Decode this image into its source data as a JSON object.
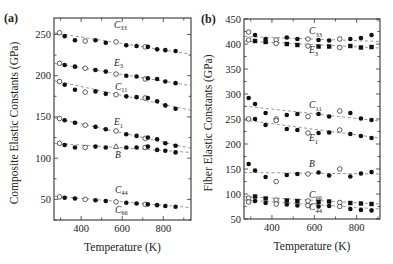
{
  "chart_data": [
    {
      "type": "scatter",
      "panel_label": "(a)",
      "title": "",
      "xlabel": "Temperature (K)",
      "ylabel": "Composite Elastic Constants (GPa)",
      "xlim": [
        268,
        935
      ],
      "ylim": [
        25,
        270
      ],
      "xticks": [
        400,
        600,
        800
      ],
      "yticks": [
        50,
        100,
        150,
        200,
        250
      ],
      "grid": false,
      "legend": "inline labels",
      "x": [
        295,
        320,
        370,
        420,
        470,
        520,
        570,
        620,
        670,
        712,
        725,
        770,
        810,
        860
      ],
      "series": [
        {
          "name": "C33",
          "label_main": "C",
          "label_sub": "33",
          "label_pos": [
            560,
            258
          ],
          "fit": [
            252,
            226
          ],
          "values": [
            252,
            248,
            243,
            242,
            243,
            240,
            241,
            237,
            236,
            235,
            235,
            232,
            231,
            230
          ],
          "markers": [
            "o",
            "f",
            "f",
            "o",
            "f",
            "f",
            "o",
            "f",
            "f",
            "o",
            "f",
            "f",
            "f",
            "f"
          ]
        },
        {
          "name": "E3",
          "label_main": "E",
          "label_sub": "3",
          "label_pos": [
            560,
            212
          ],
          "fit": [
            215,
            188
          ],
          "values": [
            215,
            213,
            211,
            209,
            207,
            205,
            202,
            200,
            199,
            196,
            197,
            196,
            193,
            191
          ],
          "markers": [
            "o",
            "f",
            "f",
            "o",
            "f",
            "f",
            "o",
            "f",
            "f",
            "o",
            "f",
            "f",
            "f",
            "f"
          ]
        },
        {
          "name": "C11",
          "label_main": "C",
          "label_sub": "11",
          "label_pos": [
            565,
            183
          ],
          "fit": [
            194,
            158
          ],
          "values": [
            193,
            189,
            183,
            180,
            181,
            178,
            177,
            175,
            174,
            173,
            173,
            169,
            164,
            160
          ],
          "markers": [
            "o",
            "f",
            "f",
            "o",
            "f",
            "f",
            "o",
            "f",
            "f",
            "o",
            "f",
            "f",
            "f",
            "f"
          ]
        },
        {
          "name": "E1",
          "label_main": "E",
          "label_sub": "1",
          "label_pos": [
            560,
            140
          ],
          "fit": [
            149,
            112
          ],
          "values": [
            148,
            146,
            143,
            140,
            138,
            135,
            133,
            129,
            127,
            124,
            125,
            123,
            118,
            115
          ],
          "markers": [
            "o",
            "f",
            "f",
            "o",
            "f",
            "f",
            "o",
            "f",
            "f",
            "o",
            "f",
            "f",
            "f",
            "f"
          ]
        },
        {
          "name": "B",
          "label_main": "B",
          "label_sub": "",
          "label_pos": [
            565,
            100
          ],
          "fit": [
            118,
            107
          ],
          "values": [
            118,
            116,
            113,
            113,
            114,
            113,
            114,
            113,
            113,
            113,
            114,
            110,
            109,
            107
          ],
          "markers": [
            "o",
            "f",
            "f",
            "o",
            "f",
            "f",
            "t",
            "f",
            "f",
            "o",
            "f",
            "f",
            "f",
            "f"
          ]
        },
        {
          "name": "C44",
          "label_main": "C",
          "label_sub": "44",
          "label_pos": [
            565,
            58
          ],
          "fit": [
            54,
            40
          ],
          "values": [
            53,
            52,
            51,
            50,
            49,
            48,
            47,
            46,
            45,
            44,
            44,
            43,
            42,
            41
          ],
          "markers": [
            "o",
            "f",
            "f",
            "o",
            "f",
            "f",
            "o",
            "f",
            "f",
            "o",
            "f",
            "f",
            "f",
            "f"
          ]
        },
        {
          "name": "C66",
          "label_main": "C",
          "label_sub": "66",
          "label_pos": [
            565,
            34
          ],
          "fit": null,
          "values": [],
          "markers": []
        }
      ]
    },
    {
      "type": "scatter",
      "panel_label": "(b)",
      "title": "",
      "xlabel": "Temperature (K)",
      "ylabel": "Fiber Elastic Constants (GPa)",
      "xlim": [
        268,
        910
      ],
      "ylim": [
        50,
        450
      ],
      "xticks": [
        400,
        600,
        800
      ],
      "yticks": [
        50,
        100,
        150,
        200,
        250,
        300,
        350,
        400,
        450
      ],
      "grid": false,
      "legend": "inline labels",
      "x": [
        290,
        320,
        370,
        420,
        470,
        520,
        570,
        620,
        670,
        720,
        770,
        820,
        870
      ],
      "series": [
        {
          "name": "C33",
          "label_main": "C",
          "label_sub": "33",
          "label_pos": [
            575,
            420
          ],
          "fit": [
            415,
            405
          ],
          "values": [
            424,
            418,
            410,
            408,
            413,
            410,
            410,
            408,
            407,
            410,
            410,
            412,
            418
          ],
          "markers": [
            "o",
            "f",
            "f",
            "o",
            "f",
            "f",
            "o",
            "f",
            "f",
            "o",
            "f",
            "f",
            "f"
          ]
        },
        {
          "name": "E3",
          "label_main": "E",
          "label_sub": "3",
          "label_pos": [
            575,
            382
          ],
          "fit": [
            406,
            392
          ],
          "values": [
            408,
            406,
            404,
            401,
            400,
            398,
            396,
            395,
            395,
            393,
            396,
            393,
            394
          ],
          "markers": [
            "o",
            "s",
            "s",
            "o",
            "s",
            "s",
            "o",
            "s",
            "s",
            "o",
            "s",
            "s",
            "s"
          ]
        },
        {
          "name": "C11",
          "label_main": "C",
          "label_sub": "11",
          "label_pos": [
            575,
            272
          ],
          "fit": [
            276,
            246
          ],
          "values": [
            292,
            280,
            262,
            250,
            258,
            260,
            255,
            260,
            255,
            266,
            262,
            251,
            248
          ],
          "markers": [
            "f",
            "f",
            "f",
            "o",
            "f",
            "f",
            "o",
            "f",
            "f",
            "o",
            "f",
            "f",
            "f"
          ]
        },
        {
          "name": "E1",
          "label_main": "E",
          "label_sub": "1",
          "label_pos": [
            575,
            206
          ],
          "fit": [
            248,
            212
          ],
          "values": [
            250,
            250,
            238,
            247,
            230,
            228,
            222,
            222,
            223,
            228,
            220,
            216,
            212
          ],
          "markers": [
            "o",
            "f",
            "f",
            "o",
            "f",
            "f",
            "o",
            "f",
            "f",
            "o",
            "f",
            "f",
            "f"
          ]
        },
        {
          "name": "B",
          "label_main": "B",
          "label_sub": "",
          "label_pos": [
            575,
            155
          ],
          "fit": [
            143,
            140
          ],
          "values": [
            160,
            147,
            134,
            125,
            138,
            140,
            140,
            143,
            137,
            150,
            135,
            141,
            144
          ],
          "markers": [
            "f",
            "f",
            "f",
            "o",
            "f",
            "f",
            "o",
            "f",
            "f",
            "o",
            "f",
            "f",
            "f"
          ]
        },
        {
          "name": "C66",
          "label_main": "C",
          "label_sub": "66",
          "label_pos": [
            575,
            93
          ],
          "fit": [
            95,
            80
          ],
          "values": [
            92,
            95,
            91,
            88,
            87,
            86,
            86,
            84,
            85,
            83,
            82,
            81,
            80
          ],
          "markers": [
            "o",
            "s",
            "s",
            "o",
            "s",
            "s",
            "o",
            "s",
            "s",
            "o",
            "s",
            "s",
            "s"
          ]
        },
        {
          "name": "C44",
          "label_main": "C",
          "label_sub": "44",
          "label_pos": [
            575,
            68
          ],
          "fit": [
            88,
            70
          ],
          "values": [
            84,
            86,
            82,
            80,
            79,
            77,
            77,
            75,
            76,
            75,
            70,
            68,
            67
          ],
          "markers": [
            "o",
            "f",
            "f",
            "o",
            "f",
            "f",
            "o",
            "f",
            "f",
            "o",
            "f",
            "f",
            "f"
          ]
        }
      ]
    }
  ]
}
